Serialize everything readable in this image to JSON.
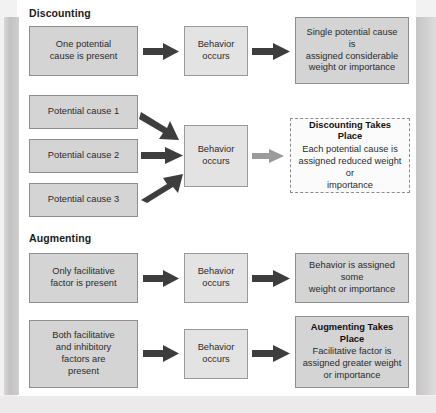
{
  "figure": {
    "title_discounting": "Discounting",
    "title_augmenting": "Augmenting"
  },
  "discounting": {
    "heading": "Discounting",
    "row1": {
      "cause": "One potential\ncause is present",
      "behavior": "Behavior\noccurs",
      "outcome": "Single potential cause is\nassigned considerable\nweight or importance"
    },
    "row2": {
      "causes": [
        "Potential cause 1",
        "Potential cause 2",
        "Potential cause 3"
      ],
      "behavior": "Behavior\noccurs",
      "outcome_title": "Discounting Takes Place",
      "outcome_body": "Each potential cause is\nassigned reduced weight or\nimportance"
    }
  },
  "augmenting": {
    "heading": "Augmenting",
    "row1": {
      "cause": "Only facilitative\nfactor is present",
      "behavior": "Behavior\noccurs",
      "outcome": "Behavior is assigned some\nweight or importance"
    },
    "row2": {
      "cause": "Both facilitative\nand inhibitory\nfactors are\npresent",
      "behavior": "Behavior\noccurs",
      "outcome_title": "Augmenting Takes Place",
      "outcome_body": "Facilitative factor is\nassigned greater weight\nor importance"
    }
  },
  "colors": {
    "box_fill": "#d4d4d4",
    "box_fill_light": "#e3e3e3",
    "box_border": "#8e8e8e",
    "arrow_dark": "#3d3d3d",
    "arrow_light": "#9b9b9b",
    "page": "#ffffff",
    "text": "#2b2b2b"
  }
}
